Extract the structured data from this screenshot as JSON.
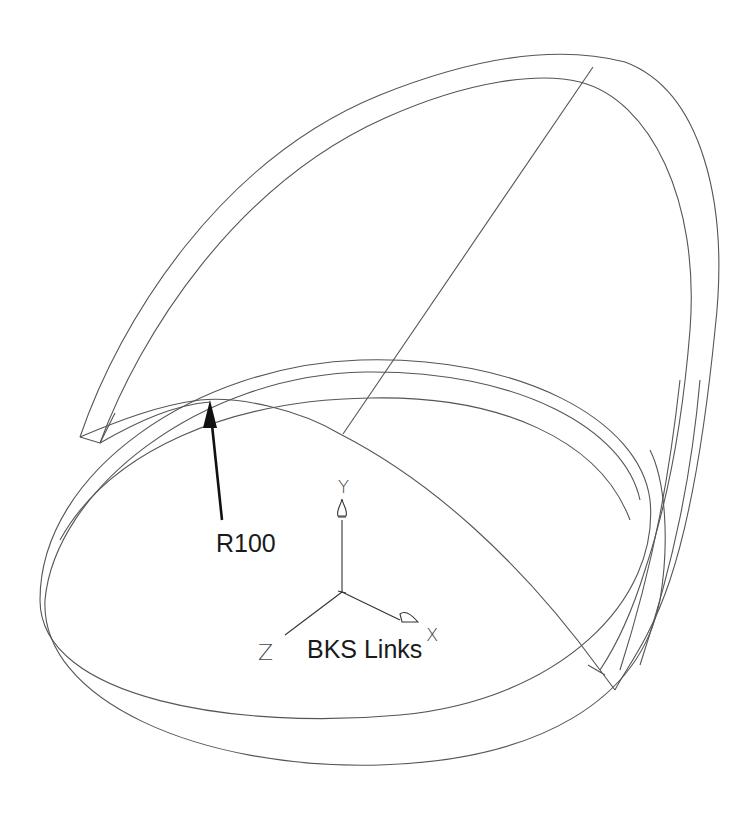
{
  "diagram": {
    "type": "CAD wireframe drawing",
    "annotations": {
      "radius_label": "R100",
      "ucs_label": "BKS Links"
    },
    "ucs_axes": {
      "x_label": "X",
      "y_label": "Y",
      "z_label": "Z"
    },
    "colors": {
      "background": "#ffffff",
      "line": "#555555",
      "text": "#1a1a1a"
    }
  }
}
